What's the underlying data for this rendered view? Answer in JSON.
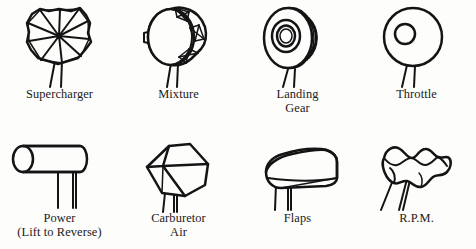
{
  "figure": {
    "background_color": "#fdfdfc",
    "ink_color": "#141414",
    "columns": 4,
    "rows": 2
  },
  "knobs": [
    {
      "id": "supercharger",
      "label": "Supercharger",
      "shape": "pinwheel-fan-radial-vanes",
      "row": 1,
      "column": 1,
      "shaft_count": 2
    },
    {
      "id": "mixture",
      "label": "Mixture",
      "shape": "drum-cylinder-with-crosshatch-rim-segments",
      "row": 1,
      "column": 2,
      "shaft_count": 2
    },
    {
      "id": "landing-gear",
      "label": "Landing\nGear",
      "shape": "wheel-tire-concentric-rings",
      "row": 1,
      "column": 3,
      "shaft_count": 2
    },
    {
      "id": "throttle",
      "label": "Throttle",
      "shape": "circle-with-offset-inner-hole",
      "row": 1,
      "column": 4,
      "shaft_count": 2
    },
    {
      "id": "power",
      "label": "Power\n(Lift to Reverse)",
      "shape": "horizontal-cylinder-lever",
      "row": 2,
      "column": 1,
      "shaft_count": 2
    },
    {
      "id": "carburetor-air",
      "label": "Carburetor\nAir",
      "shape": "tilted-isometric-cube",
      "row": 2,
      "column": 2,
      "shaft_count": 2
    },
    {
      "id": "flaps",
      "label": "Flaps",
      "shape": "airfoil-wing-section",
      "row": 2,
      "column": 3,
      "shaft_count": 2
    },
    {
      "id": "rpm",
      "label": "R.P.M.",
      "shape": "wavy-scalloped-bar",
      "row": 2,
      "column": 4,
      "shaft_count": 3
    }
  ]
}
